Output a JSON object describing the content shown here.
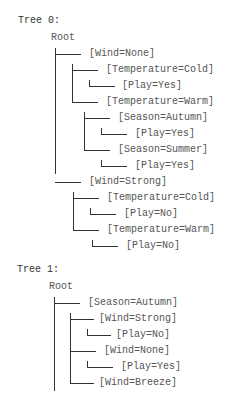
{
  "trees": [
    {
      "title": "Tree 0:",
      "root": "Root",
      "nodes": [
        "[Wind=None]",
        "[Temperature=Cold]",
        "[Play=Yes]",
        "[Temperature=Warm]",
        "[Season=Autumn]",
        "[Play=Yes]",
        "[Season=Summer]",
        "[Play=Yes]",
        "[Wind=Strong]",
        "[Temperature=Cold]",
        "[Play=No]",
        "[Temperature=Warm]",
        "[Play=No]"
      ]
    },
    {
      "title": "Tree 1:",
      "root": "Root",
      "nodes": [
        "[Season=Autumn]",
        "[Wind=Strong]",
        "[Play=No]",
        "[Wind=None]",
        "[Play=Yes]",
        "[Wind=Breeze]"
      ]
    }
  ]
}
